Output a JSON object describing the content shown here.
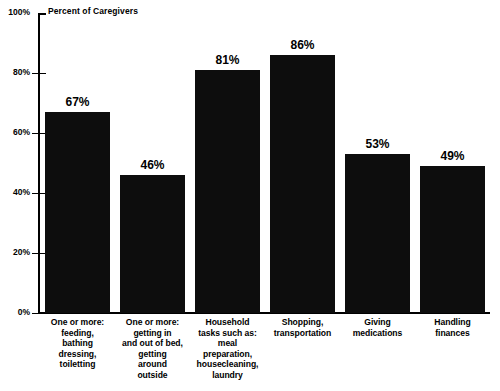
{
  "chart_data": {
    "type": "bar",
    "title": "",
    "subtitle": "",
    "axis_title": "Percent of Caregivers",
    "xlabel": "",
    "ylabel": "Percent of Caregivers",
    "ylim": [
      0,
      100
    ],
    "grid": false,
    "legend": "none",
    "orientation": "vertical",
    "bar_color": "#0d0d0d",
    "background_color": "#ffffff",
    "y_ticks": [
      "0%",
      "20%",
      "40%",
      "60%",
      "80%",
      "100%"
    ],
    "y_tick_values": [
      0,
      20,
      40,
      60,
      80,
      100
    ],
    "categories": [
      "One or more: feeding, bathing dressing, toiletting",
      "One or more: getting in and out of bed, getting around outside",
      "Household tasks such as: meal preparation, housecleaning, laundry",
      "Shopping, transportation",
      "Giving medications",
      "Handling finances"
    ],
    "category_lines": [
      [
        "One or more:",
        "feeding,",
        "bathing",
        "dressing,",
        "toiletting"
      ],
      [
        "One or more:",
        "getting in",
        "and out of bed,",
        "getting",
        "around",
        "outside"
      ],
      [
        "Household",
        "tasks such as:",
        "meal",
        "preparation,",
        "housecleaning,",
        "laundry"
      ],
      [
        "Shopping,",
        "transportation"
      ],
      [
        "Giving",
        "medications"
      ],
      [
        "Handling",
        "finances"
      ]
    ],
    "values": [
      67,
      46,
      81,
      86,
      53,
      49
    ],
    "value_labels": [
      "67%",
      "46%",
      "81%",
      "86%",
      "53%",
      "49%"
    ]
  }
}
